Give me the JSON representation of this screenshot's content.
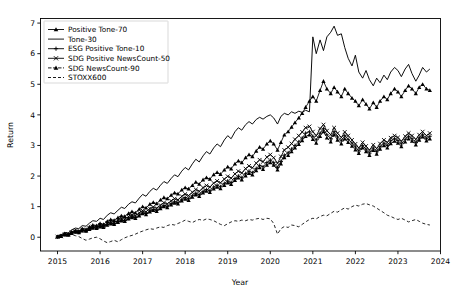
{
  "chart_data": {
    "type": "line",
    "title": "",
    "xlabel": "Year",
    "ylabel": "Return",
    "xlim": [
      2014.6,
      2024.0
    ],
    "ylim": [
      -0.45,
      7.15
    ],
    "xticks": [
      "2015",
      "2016",
      "2017",
      "2018",
      "2019",
      "2020",
      "2021",
      "2022",
      "2023",
      "2024"
    ],
    "yticks": [
      "0",
      "1",
      "2",
      "3",
      "4",
      "5",
      "6",
      "7"
    ],
    "grid": false,
    "legend_position": "upper-left",
    "x": [
      2015.0,
      2015.08,
      2015.17,
      2015.25,
      2015.33,
      2015.42,
      2015.5,
      2015.58,
      2015.67,
      2015.75,
      2015.83,
      2015.92,
      2016.0,
      2016.08,
      2016.17,
      2016.25,
      2016.33,
      2016.42,
      2016.5,
      2016.58,
      2016.67,
      2016.75,
      2016.83,
      2016.92,
      2017.0,
      2017.08,
      2017.17,
      2017.25,
      2017.33,
      2017.42,
      2017.5,
      2017.58,
      2017.67,
      2017.75,
      2017.83,
      2017.92,
      2018.0,
      2018.08,
      2018.17,
      2018.25,
      2018.33,
      2018.42,
      2018.5,
      2018.58,
      2018.67,
      2018.75,
      2018.83,
      2018.92,
      2019.0,
      2019.08,
      2019.17,
      2019.25,
      2019.33,
      2019.42,
      2019.5,
      2019.58,
      2019.67,
      2019.75,
      2019.83,
      2019.92,
      2020.0,
      2020.08,
      2020.17,
      2020.25,
      2020.33,
      2020.42,
      2020.5,
      2020.58,
      2020.67,
      2020.75,
      2020.83,
      2020.92,
      2021.0,
      2021.08,
      2021.17,
      2021.25,
      2021.33,
      2021.42,
      2021.5,
      2021.58,
      2021.67,
      2021.75,
      2021.83,
      2021.92,
      2022.0,
      2022.08,
      2022.17,
      2022.25,
      2022.33,
      2022.42,
      2022.5,
      2022.58,
      2022.67,
      2022.75,
      2022.83,
      2022.92,
      2023.0,
      2023.08,
      2023.17,
      2023.25,
      2023.33,
      2023.42,
      2023.5,
      2023.58,
      2023.67,
      2023.75
    ],
    "series": [
      {
        "name": "Positive Tone-70",
        "marker": "triangle",
        "dash": "none",
        "values": [
          0.02,
          0.05,
          0.12,
          0.1,
          0.18,
          0.22,
          0.2,
          0.28,
          0.26,
          0.34,
          0.4,
          0.38,
          0.45,
          0.42,
          0.52,
          0.58,
          0.55,
          0.64,
          0.7,
          0.68,
          0.78,
          0.84,
          0.8,
          0.92,
          1.0,
          0.96,
          1.08,
          1.14,
          1.1,
          1.22,
          1.3,
          1.26,
          1.38,
          1.45,
          1.42,
          1.55,
          1.62,
          1.58,
          1.7,
          1.8,
          1.74,
          1.88,
          1.95,
          1.9,
          2.05,
          2.12,
          2.06,
          2.2,
          2.3,
          2.24,
          2.4,
          2.5,
          2.44,
          2.6,
          2.7,
          2.64,
          2.82,
          2.95,
          2.88,
          3.05,
          3.15,
          3.05,
          2.85,
          3.1,
          3.35,
          3.45,
          3.6,
          3.75,
          3.9,
          4.05,
          4.25,
          4.45,
          4.6,
          4.45,
          4.8,
          5.1,
          4.85,
          4.7,
          4.9,
          4.75,
          4.6,
          4.85,
          4.7,
          4.55,
          4.45,
          4.3,
          4.5,
          4.35,
          4.2,
          4.4,
          4.25,
          4.45,
          4.6,
          4.5,
          4.7,
          4.85,
          4.75,
          4.6,
          4.8,
          4.95,
          4.85,
          4.7,
          4.9,
          5.0,
          4.85,
          4.8
        ]
      },
      {
        "name": "Tone-30",
        "marker": "none",
        "dash": "none",
        "values": [
          0.03,
          0.08,
          0.15,
          0.14,
          0.24,
          0.3,
          0.28,
          0.38,
          0.36,
          0.46,
          0.54,
          0.52,
          0.62,
          0.58,
          0.72,
          0.8,
          0.76,
          0.88,
          0.98,
          0.94,
          1.08,
          1.16,
          1.12,
          1.28,
          1.4,
          1.34,
          1.5,
          1.6,
          1.54,
          1.7,
          1.82,
          1.76,
          1.92,
          2.04,
          1.98,
          2.16,
          2.28,
          2.2,
          2.4,
          2.55,
          2.46,
          2.66,
          2.8,
          2.72,
          2.92,
          3.05,
          2.96,
          3.18,
          3.32,
          3.22,
          3.45,
          3.58,
          3.5,
          3.68,
          3.78,
          3.7,
          3.85,
          3.92,
          3.86,
          3.95,
          4.0,
          3.9,
          3.7,
          3.95,
          4.05,
          4.0,
          4.1,
          4.05,
          4.12,
          4.08,
          4.15,
          4.1,
          6.55,
          6.0,
          6.45,
          6.1,
          6.55,
          6.7,
          6.9,
          6.6,
          6.65,
          6.2,
          5.85,
          5.6,
          5.95,
          5.4,
          5.2,
          5.45,
          5.15,
          4.95,
          5.2,
          5.05,
          5.3,
          5.15,
          5.4,
          5.55,
          5.45,
          5.25,
          5.5,
          5.65,
          5.35,
          5.1,
          5.3,
          5.55,
          5.4,
          5.5
        ]
      },
      {
        "name": "ESG Positive Tone-10",
        "marker": "plus",
        "dash": "none",
        "values": [
          0.01,
          0.04,
          0.09,
          0.08,
          0.14,
          0.18,
          0.16,
          0.22,
          0.21,
          0.27,
          0.32,
          0.3,
          0.36,
          0.34,
          0.42,
          0.46,
          0.44,
          0.51,
          0.56,
          0.54,
          0.62,
          0.67,
          0.64,
          0.73,
          0.8,
          0.77,
          0.86,
          0.91,
          0.88,
          0.97,
          1.04,
          1.01,
          1.1,
          1.16,
          1.13,
          1.24,
          1.3,
          1.26,
          1.36,
          1.44,
          1.39,
          1.5,
          1.56,
          1.52,
          1.64,
          1.7,
          1.65,
          1.76,
          1.84,
          1.79,
          1.92,
          2.0,
          1.95,
          2.08,
          2.16,
          2.11,
          2.25,
          2.35,
          2.3,
          2.44,
          2.52,
          2.44,
          2.28,
          2.48,
          2.68,
          2.76,
          2.88,
          3.0,
          3.12,
          3.24,
          3.4,
          3.45,
          3.3,
          3.18,
          3.4,
          3.55,
          3.35,
          3.22,
          3.45,
          3.28,
          3.15,
          3.32,
          3.2,
          3.08,
          2.95,
          2.82,
          3.0,
          2.88,
          2.75,
          2.92,
          2.8,
          2.96,
          3.08,
          3.0,
          3.15,
          3.22,
          3.16,
          3.05,
          3.2,
          3.3,
          3.22,
          3.1,
          3.25,
          3.35,
          3.22,
          3.3
        ]
      },
      {
        "name": "SDG Positive NewsCount-50",
        "marker": "x",
        "dash": "none",
        "values": [
          0.02,
          0.03,
          0.1,
          0.09,
          0.16,
          0.2,
          0.18,
          0.25,
          0.23,
          0.3,
          0.35,
          0.33,
          0.4,
          0.37,
          0.46,
          0.51,
          0.48,
          0.56,
          0.62,
          0.59,
          0.68,
          0.73,
          0.7,
          0.8,
          0.87,
          0.83,
          0.94,
          0.99,
          0.95,
          1.05,
          1.13,
          1.09,
          1.19,
          1.26,
          1.22,
          1.34,
          1.41,
          1.36,
          1.47,
          1.56,
          1.5,
          1.62,
          1.69,
          1.64,
          1.77,
          1.84,
          1.78,
          1.9,
          1.99,
          1.93,
          2.07,
          2.16,
          2.1,
          2.24,
          2.33,
          2.27,
          2.42,
          2.53,
          2.47,
          2.62,
          2.7,
          2.6,
          2.42,
          2.64,
          2.85,
          2.94,
          3.06,
          3.2,
          3.32,
          3.44,
          3.58,
          3.62,
          3.45,
          3.32,
          3.55,
          3.68,
          3.48,
          3.35,
          3.58,
          3.4,
          3.26,
          3.44,
          3.32,
          3.18,
          3.05,
          2.92,
          3.1,
          2.98,
          2.85,
          3.02,
          2.9,
          3.06,
          3.18,
          3.1,
          3.25,
          3.32,
          3.26,
          3.14,
          3.3,
          3.4,
          3.32,
          3.2,
          3.35,
          3.45,
          3.32,
          3.4
        ]
      },
      {
        "name": "SDG NewsCount-90",
        "marker": "triangle",
        "dash": "dash-marker",
        "values": [
          0.01,
          0.03,
          0.08,
          0.07,
          0.13,
          0.17,
          0.15,
          0.21,
          0.2,
          0.26,
          0.3,
          0.29,
          0.34,
          0.32,
          0.4,
          0.44,
          0.42,
          0.49,
          0.54,
          0.52,
          0.6,
          0.64,
          0.62,
          0.7,
          0.77,
          0.74,
          0.83,
          0.88,
          0.85,
          0.94,
          1.0,
          0.97,
          1.06,
          1.12,
          1.09,
          1.19,
          1.25,
          1.21,
          1.31,
          1.39,
          1.34,
          1.45,
          1.51,
          1.47,
          1.58,
          1.64,
          1.59,
          1.7,
          1.78,
          1.73,
          1.86,
          1.94,
          1.88,
          2.01,
          2.09,
          2.04,
          2.18,
          2.28,
          2.22,
          2.36,
          2.44,
          2.36,
          2.2,
          2.4,
          2.6,
          2.68,
          2.8,
          2.92,
          3.04,
          3.16,
          3.3,
          3.35,
          3.2,
          3.08,
          3.3,
          3.45,
          3.25,
          3.12,
          3.35,
          3.18,
          3.05,
          3.22,
          3.1,
          2.98,
          2.86,
          2.74,
          2.92,
          2.8,
          2.68,
          2.84,
          2.72,
          2.88,
          3.0,
          2.92,
          3.06,
          3.14,
          3.08,
          2.96,
          3.12,
          3.22,
          3.14,
          3.02,
          3.18,
          3.28,
          3.15,
          3.22
        ]
      },
      {
        "name": "STOXX600",
        "marker": "none",
        "dash": "dashed",
        "values": [
          0.0,
          0.04,
          0.1,
          0.06,
          0.09,
          0.05,
          0.02,
          -0.04,
          -0.1,
          -0.06,
          -0.02,
          0.0,
          -0.05,
          -0.12,
          -0.18,
          -0.14,
          -0.1,
          -0.15,
          -0.08,
          -0.02,
          0.03,
          0.06,
          0.1,
          0.16,
          0.2,
          0.24,
          0.28,
          0.26,
          0.3,
          0.34,
          0.32,
          0.38,
          0.42,
          0.4,
          0.45,
          0.5,
          0.56,
          0.52,
          0.48,
          0.54,
          0.58,
          0.55,
          0.6,
          0.58,
          0.54,
          0.48,
          0.42,
          0.38,
          0.44,
          0.5,
          0.54,
          0.52,
          0.56,
          0.54,
          0.58,
          0.56,
          0.6,
          0.62,
          0.58,
          0.62,
          0.6,
          0.45,
          0.1,
          0.28,
          0.35,
          0.32,
          0.4,
          0.38,
          0.34,
          0.42,
          0.5,
          0.58,
          0.62,
          0.6,
          0.68,
          0.72,
          0.7,
          0.78,
          0.85,
          0.82,
          0.9,
          0.96,
          0.92,
          1.0,
          1.05,
          1.02,
          1.08,
          1.1,
          1.06,
          1.02,
          0.95,
          0.88,
          0.8,
          0.72,
          0.68,
          0.62,
          0.58,
          0.62,
          0.56,
          0.5,
          0.54,
          0.58,
          0.52,
          0.46,
          0.42,
          0.4
        ]
      }
    ]
  },
  "legend": {
    "items": [
      {
        "label": "Positive Tone-70"
      },
      {
        "label": "Tone-30"
      },
      {
        "label": "ESG Positive Tone-10"
      },
      {
        "label": "SDG Positive NewsCount-50"
      },
      {
        "label": "SDG NewsCount-90"
      },
      {
        "label": "STOXX600"
      }
    ]
  }
}
